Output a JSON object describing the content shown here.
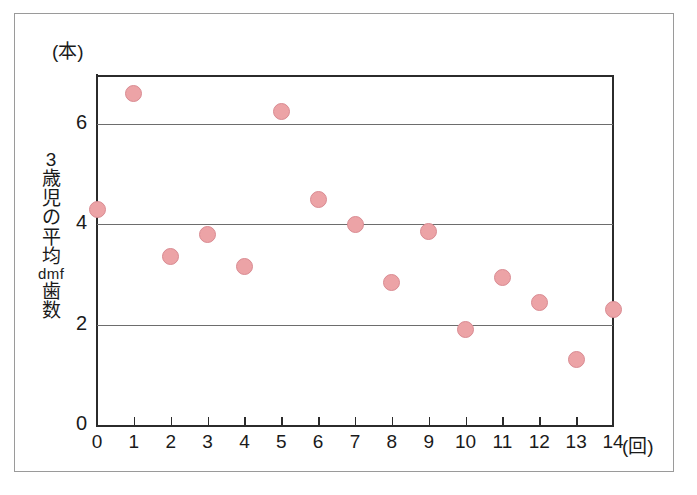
{
  "figure": {
    "unit_top_label": "(本)",
    "y_axis_title_chars": [
      "3",
      "歳",
      "児",
      "の",
      "平",
      "均",
      "dmf",
      "歯",
      "数"
    ],
    "y_axis_title_text": "3歳児の平均dmf歯数",
    "x_unit_label": "(回)",
    "marker_color": "#eca3a6",
    "marker_edge_color": "#d98b92",
    "axis_color": "#2b2b2b",
    "gridline_color": "#6d6d6d",
    "frame_color": "#9a9a9a",
    "background_color": "#ffffff"
  },
  "chart_data": {
    "type": "scatter",
    "title": "",
    "subtitle": "",
    "xlabel": "(回)",
    "ylabel": "3歳児の平均dmf歯数 (本)",
    "x": [
      0,
      1,
      2,
      3,
      4,
      5,
      6,
      7,
      8,
      9,
      10,
      11,
      12,
      13,
      14
    ],
    "values": [
      4.3,
      6.6,
      3.35,
      3.8,
      3.15,
      6.25,
      4.5,
      4.0,
      2.85,
      3.85,
      1.9,
      2.95,
      2.45,
      1.3,
      2.3
    ],
    "xlim": [
      0,
      14
    ],
    "ylim": [
      0,
      7
    ],
    "x_tick_labels": [
      "0",
      "1",
      "2",
      "3",
      "4",
      "5",
      "6",
      "7",
      "8",
      "9",
      "10",
      "11",
      "12",
      "13",
      "14"
    ],
    "y_tick_labels": [
      "0",
      "2",
      "4",
      "6"
    ],
    "y_ticks": [
      0,
      2,
      4,
      6
    ],
    "gridlines_y": [
      2,
      4,
      6
    ],
    "grid": "horizontal-only",
    "legend": "none",
    "annotations": [],
    "points": [
      {
        "x": 0,
        "y": 4.3
      },
      {
        "x": 1,
        "y": 6.6
      },
      {
        "x": 2,
        "y": 3.35
      },
      {
        "x": 3,
        "y": 3.8
      },
      {
        "x": 4,
        "y": 3.15
      },
      {
        "x": 5,
        "y": 6.25
      },
      {
        "x": 6,
        "y": 4.5
      },
      {
        "x": 7,
        "y": 4.0
      },
      {
        "x": 8,
        "y": 2.85
      },
      {
        "x": 9,
        "y": 3.85
      },
      {
        "x": 10,
        "y": 1.9
      },
      {
        "x": 11,
        "y": 2.95
      },
      {
        "x": 12,
        "y": 2.45
      },
      {
        "x": 13,
        "y": 1.3
      },
      {
        "x": 14,
        "y": 2.3
      }
    ]
  }
}
